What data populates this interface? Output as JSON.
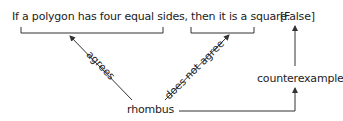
{
  "diagram": {
    "statement": "If a polygon has four equal sides, then it is a square.",
    "truth_value": "[False]",
    "center_node": "rhombus",
    "result_node": "counterexample",
    "edges": {
      "hypothesis_label": "agrees",
      "conclusion_label": "does not agree"
    },
    "colors": {
      "text": "#222222",
      "lines": "#333333",
      "background": "#ffffff"
    }
  }
}
